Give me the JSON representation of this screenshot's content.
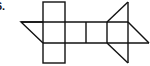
{
  "problem": {
    "number_label": "6."
  },
  "diagram": {
    "type": "net",
    "stroke_color": "#111111",
    "stroke_width": 1.4
  }
}
